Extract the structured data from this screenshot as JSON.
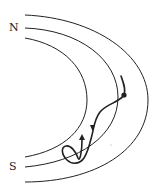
{
  "diagram": {
    "labels": {
      "north": "N",
      "south": "S"
    },
    "colors": {
      "stroke": "#222222",
      "background": "#ffffff"
    },
    "field_lines": [
      {
        "name": "outer-field-line"
      },
      {
        "name": "middle-field-line"
      },
      {
        "name": "inner-field-line"
      }
    ],
    "particle_path": {
      "start_marker": "dot",
      "arrows": [
        "down",
        "up"
      ]
    }
  }
}
